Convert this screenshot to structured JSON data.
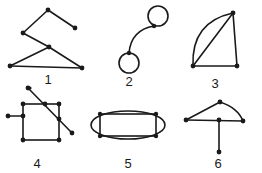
{
  "figures": [
    {
      "id": 1,
      "label": "1"
    },
    {
      "id": 2,
      "label": "2"
    },
    {
      "id": 3,
      "label": "3"
    },
    {
      "id": 4,
      "label": "4"
    },
    {
      "id": 5,
      "label": "5"
    },
    {
      "id": 6,
      "label": "6"
    }
  ],
  "colors": {
    "ink": "#1a1a1a",
    "background": "#ffffff"
  }
}
